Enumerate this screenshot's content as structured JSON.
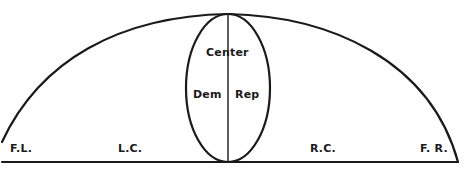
{
  "diagram": {
    "type": "political spectrum arc",
    "labels": {
      "center": "Center",
      "dem": "Dem",
      "rep": "Rep",
      "far_left": "F.L.",
      "left_center": "L.C.",
      "right_center": "R.C.",
      "far_right": "F. R."
    },
    "colors": {
      "line": "#1a1a1a",
      "background": "#ffffff"
    }
  }
}
